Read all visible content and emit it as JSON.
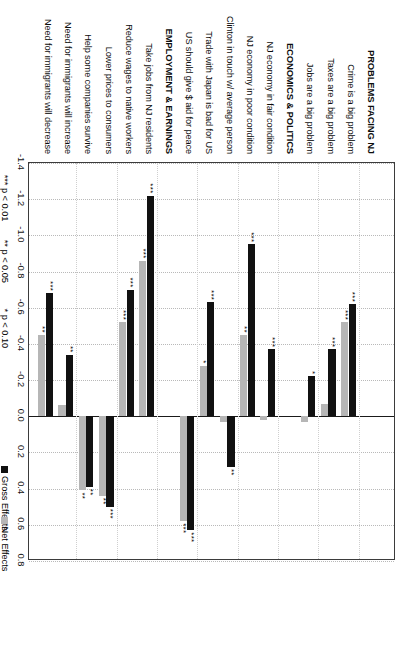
{
  "chart_data": {
    "type": "bar",
    "orientation": "horizontal",
    "title": "",
    "subtitle": "",
    "xlabel": "",
    "ylabel": "",
    "xlim": [
      -1.4,
      0.8
    ],
    "xticks": [
      "-1.4",
      "-1.2",
      "-1.0",
      "-0.8",
      "-0.6",
      "-0.4",
      "-0.2",
      "0.0",
      "0.2",
      "0.4",
      "0.6",
      "0.8"
    ],
    "xtick_values": [
      -1.4,
      -1.2,
      -1.0,
      -0.8,
      -0.6,
      -0.4,
      -0.2,
      0.0,
      0.2,
      0.4,
      0.6,
      0.8
    ],
    "grid": true,
    "legend_position": "bottom",
    "legend": [
      {
        "name": "Gross Effects",
        "color": "#111111"
      },
      {
        "name": "Net Effects",
        "color": "#b6b6b6"
      }
    ],
    "series": [
      {
        "name": "Gross Effects",
        "color": "#111111"
      },
      {
        "name": "Net Effects",
        "color": "#b6b6b6"
      }
    ],
    "sections": [
      {
        "header": "PROBLEMS FACING NJ",
        "rows": [
          {
            "label": "Crime is a big problem",
            "gross": -0.62,
            "net": -0.52,
            "gross_sig": "***",
            "net_sig": "***"
          },
          {
            "label": "Taxes are a big problem",
            "gross": -0.37,
            "net": -0.07,
            "gross_sig": "***",
            "net_sig": ""
          },
          {
            "label": "Jobs are a big problem",
            "gross": -0.22,
            "net": 0.03,
            "gross_sig": "*",
            "net_sig": ""
          }
        ]
      },
      {
        "header": "ECONOMICS & POLITICS",
        "rows": [
          {
            "label": "NJ economy in fair condition",
            "gross": -0.37,
            "net": 0.02,
            "gross_sig": "***",
            "net_sig": ""
          },
          {
            "label": "NJ economy in poor condition",
            "gross": -0.95,
            "net": -0.45,
            "gross_sig": "***",
            "net_sig": "**"
          },
          {
            "label": "Clinton in touch w/ average person",
            "gross": 0.28,
            "net": 0.03,
            "gross_sig": "**",
            "net_sig": ""
          },
          {
            "label": "Trade with Japan is bad for US",
            "gross": -0.63,
            "net": -0.28,
            "gross_sig": "***",
            "net_sig": "*"
          },
          {
            "label": "US should give $ aid for peace",
            "gross": 0.63,
            "net": 0.58,
            "gross_sig": "***",
            "net_sig": "***"
          }
        ]
      },
      {
        "header": "EMPLOYMENT & EARNINGS",
        "rows": [
          {
            "label": "Take jobs from NJ residents",
            "gross": -1.22,
            "net": -0.86,
            "gross_sig": "***",
            "net_sig": "***"
          },
          {
            "label": "Reduce wages to native workers",
            "gross": -0.7,
            "net": -0.52,
            "gross_sig": "***",
            "net_sig": "***"
          },
          {
            "label": "Lower prices to consumers",
            "gross": 0.5,
            "net": 0.44,
            "gross_sig": "***",
            "net_sig": "**"
          },
          {
            "label": "Help some companies survive",
            "gross": 0.39,
            "net": 0.41,
            "gross_sig": "**",
            "net_sig": "**"
          },
          {
            "label": "Need for immigrants will increase",
            "gross": -0.34,
            "net": -0.06,
            "gross_sig": "**",
            "net_sig": ""
          },
          {
            "label": "Need for immigrants will decrease",
            "gross": -0.68,
            "net": -0.45,
            "gross_sig": "***",
            "net_sig": "**"
          }
        ]
      }
    ],
    "significance_notes": [
      "*** p < 0.01",
      "** p < 0.05",
      "* p < 0.10"
    ]
  }
}
